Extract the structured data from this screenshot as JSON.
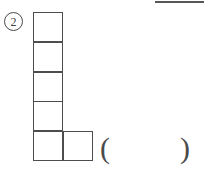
{
  "page": {
    "background_color": "#ffffff",
    "ink_color": "#4d4d4d"
  },
  "top_rule": {
    "name": "page-divider-rule",
    "color": "#565656"
  },
  "item": {
    "number_label": "2",
    "circled": true
  },
  "figure": {
    "type": "polyomino-grid",
    "cell_size_px": 30,
    "total_cells": 6,
    "columns": 2,
    "rows": 5,
    "cells": [
      {
        "id": "cell-r1c1",
        "row": 1,
        "col": 1,
        "x": 0,
        "y": 0
      },
      {
        "id": "cell-r2c1",
        "row": 2,
        "col": 1,
        "x": 0,
        "y": 29.8
      },
      {
        "id": "cell-r3c1",
        "row": 3,
        "col": 1,
        "x": 0,
        "y": 59.6
      },
      {
        "id": "cell-r4c1",
        "row": 4,
        "col": 1,
        "x": 0,
        "y": 89.4
      },
      {
        "id": "cell-r5c1",
        "row": 5,
        "col": 1,
        "x": 0,
        "y": 119.2
      },
      {
        "id": "cell-r5c2",
        "row": 5,
        "col": 2,
        "x": 29.8,
        "y": 119.2
      }
    ]
  },
  "answer_blank": {
    "open_paren": "(",
    "close_paren": ")",
    "value": ""
  }
}
